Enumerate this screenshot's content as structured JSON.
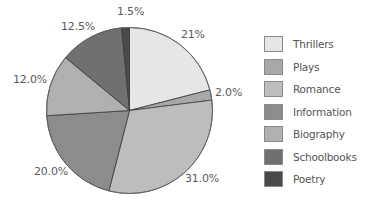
{
  "chart_data": {
    "type": "pie",
    "title": "",
    "start_angle": "12 o'clock",
    "direction": "clockwise",
    "categories": [
      "Thrillers",
      "Plays",
      "Romance",
      "Information",
      "Biography",
      "Schoolbooks",
      "Poetry"
    ],
    "values": [
      21,
      2.0,
      31.0,
      20.0,
      12.0,
      12.5,
      1.5
    ],
    "value_labels": [
      "21%",
      "2.0%",
      "31.0%",
      "20.0%",
      "12.0%",
      "12.5%",
      "1.5%"
    ],
    "colors": [
      "#e6e6e6",
      "#a8a8a8",
      "#bdbdbd",
      "#8c8c8c",
      "#b0b0b0",
      "#707070",
      "#4a4a4a"
    ],
    "legend_position": "right",
    "units": "%"
  },
  "legend": {
    "items": [
      {
        "label": "Thrillers",
        "color": "#e6e6e6"
      },
      {
        "label": "Plays",
        "color": "#a8a8a8"
      },
      {
        "label": "Romance",
        "color": "#bdbdbd"
      },
      {
        "label": "Information",
        "color": "#8c8c8c"
      },
      {
        "label": "Biography",
        "color": "#b0b0b0"
      },
      {
        "label": "Schoolbooks",
        "color": "#707070"
      },
      {
        "label": "Poetry",
        "color": "#4a4a4a"
      }
    ]
  },
  "labels": {
    "thrillers": "21%",
    "plays": "2.0%",
    "romance": "31.0%",
    "information": "20.0%",
    "biography": "12.0%",
    "schoolbooks": "12.5%",
    "poetry": "1.5%"
  }
}
